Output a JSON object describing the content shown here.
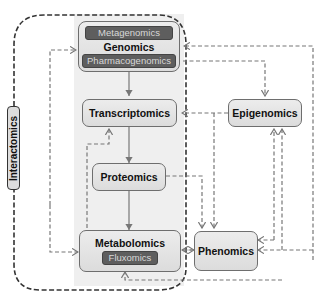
{
  "diagram": {
    "outer_group": {
      "label": "Interactomics"
    },
    "nodes": {
      "genomics": {
        "label": "Genomics",
        "sub_top": "Metagenomics",
        "sub_bottom": "Pharmacogenomics"
      },
      "transcriptomics": {
        "label": "Transcriptomics"
      },
      "proteomics": {
        "label": "Proteomics"
      },
      "metabolomics": {
        "label": "Metabolomics",
        "sub": "Fluxomics"
      },
      "epigenomics": {
        "label": "Epigenomics"
      },
      "phenomics": {
        "label": "Phenomics"
      }
    },
    "edges": [
      {
        "from": "Genomics",
        "to": "Transcriptomics",
        "style": "solid"
      },
      {
        "from": "Transcriptomics",
        "to": "Proteomics",
        "style": "solid"
      },
      {
        "from": "Proteomics",
        "to": "Metabolomics",
        "style": "solid"
      },
      {
        "from": "Metabolomics",
        "to": "Transcriptomics",
        "style": "dashed"
      },
      {
        "from": "Interactomics",
        "to": "Genomics",
        "style": "dashed"
      },
      {
        "from": "Interactomics",
        "to": "Metabolomics",
        "style": "dashed"
      },
      {
        "from": "Genomics",
        "to": "Epigenomics",
        "style": "dashed",
        "bidirectional": true
      },
      {
        "from": "Epigenomics",
        "to": "Transcriptomics",
        "style": "dashed"
      },
      {
        "from": "Epigenomics",
        "to": "Phenomics",
        "style": "dashed"
      },
      {
        "from": "Proteomics",
        "to": "Phenomics",
        "style": "dashed"
      },
      {
        "from": "Phenomics",
        "to": "Epigenomics",
        "style": "dashed"
      },
      {
        "from": "Phenomics",
        "to": "Genomics",
        "style": "dashed"
      },
      {
        "from": "Metabolomics",
        "to": "Phenomics",
        "style": "dashed",
        "bidirectional": true
      },
      {
        "from": "Epigenomics",
        "to": "Metabolomics",
        "style": "dashed"
      }
    ],
    "colors": {
      "node_fill": "#e2e2e2",
      "node_border": "#6e6e6e",
      "sub_fill": "#5e5e5e",
      "sub_text": "#d8d8d8",
      "column_bg": "#efefef",
      "edge": "#777777",
      "outer_border": "#333333"
    }
  }
}
